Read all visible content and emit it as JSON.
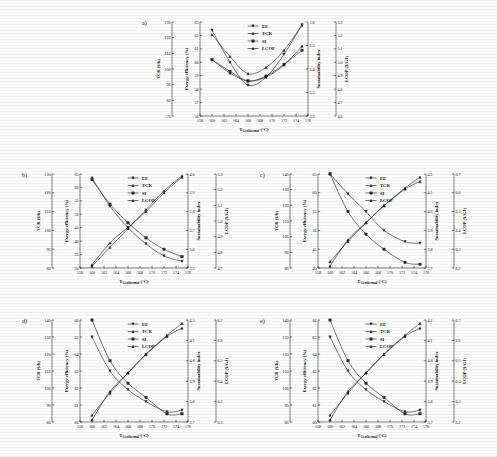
{
  "figure": {
    "background": "#ffffff",
    "xlabel": "T",
    "xlabel_sub": "Geothermal",
    "xlabel_unit": " (°C)",
    "legend": [
      {
        "key": "EE",
        "label": "EE",
        "marker": "triangle-down"
      },
      {
        "key": "TCR",
        "label": "TCR",
        "marker": "triangle-up"
      },
      {
        "key": "SI",
        "label": "SI",
        "marker": "square"
      },
      {
        "key": "LCOP",
        "label": "LCOP",
        "marker": "triangle-up"
      }
    ],
    "axis_titles": {
      "tcr": "TCR ($/h)",
      "ee": "Exergy efficiency (%)",
      "si": "Sustainability index",
      "lcop": "LCOP ($/GJ)"
    }
  },
  "chart_data": [
    {
      "id": "a",
      "panel_label": "a)",
      "type": "line",
      "title": "",
      "xlabel": "T_Geothermal (°C)",
      "x": [
        160,
        163,
        166,
        169,
        172,
        175
      ],
      "xlim": [
        158,
        176
      ],
      "xticks": [
        158,
        160,
        162,
        164,
        166,
        168,
        170,
        172,
        174,
        176
      ],
      "grid": false,
      "legend_position": "top-center",
      "axes": [
        {
          "name": "TCR ($/h)",
          "side": "left-outer",
          "lim": [
            70,
            130
          ],
          "ticks": [
            70,
            80,
            90,
            100,
            110,
            120,
            130
          ]
        },
        {
          "name": "Exergy efficiency (%)",
          "side": "left-inner",
          "lim": [
            56,
            63
          ],
          "ticks": [
            56,
            57,
            58,
            59,
            60,
            61,
            62,
            63
          ]
        },
        {
          "name": "Sustainability index",
          "side": "right-inner",
          "lim": [
            3.2,
            3.6
          ],
          "ticks": [
            3.2,
            3.3,
            3.4,
            3.5,
            3.6
          ]
        },
        {
          "name": "LCOP ($/GJ)",
          "side": "right-outer",
          "lim": [
            4.6,
            5.3
          ],
          "ticks": [
            4.6,
            4.7,
            4.8,
            4.9,
            5.0,
            5.1,
            5.2,
            5.3
          ]
        }
      ],
      "series": [
        {
          "name": "EE",
          "axis": "Exergy efficiency (%)",
          "values": [
            62.4,
            60.0,
            58.3,
            58.9,
            60.6,
            62.8
          ]
        },
        {
          "name": "TCR",
          "axis": "TCR ($/h)",
          "values": [
            122.0,
            108.0,
            97.0,
            101.0,
            112.0,
            128.0
          ]
        },
        {
          "name": "SI",
          "axis": "Sustainability index",
          "values": [
            3.44,
            3.39,
            3.35,
            3.37,
            3.42,
            3.48
          ]
        },
        {
          "name": "LCOP",
          "axis": "LCOP ($/GJ)",
          "values": [
            5.02,
            4.92,
            4.86,
            4.89,
            4.98,
            5.12
          ]
        }
      ]
    },
    {
      "id": "b",
      "panel_label": "b)",
      "type": "line",
      "xlabel": "T_Geothermal (°C)",
      "x": [
        160,
        163,
        166,
        169,
        172,
        175
      ],
      "xlim": [
        158,
        176
      ],
      "xticks": [
        158,
        160,
        162,
        164,
        166,
        168,
        170,
        172,
        174,
        176
      ],
      "grid": false,
      "legend_position": "top-center",
      "axes": [
        {
          "name": "TCR ($/h)",
          "side": "left-outer",
          "lim": [
            80,
            130
          ],
          "ticks": [
            80,
            90,
            100,
            110,
            120,
            130
          ]
        },
        {
          "name": "Exergy efficiency (%)",
          "side": "left-inner",
          "lim": [
            30,
            65
          ],
          "ticks": [
            30,
            35,
            40,
            45,
            50,
            55,
            60,
            65
          ]
        },
        {
          "name": "Sustainability index",
          "side": "right-inner",
          "lim": [
            3.5,
            4.0
          ],
          "ticks": [
            3.5,
            3.6,
            3.7,
            3.8,
            3.9,
            4.0
          ]
        },
        {
          "name": "LCOP ($/GJ)",
          "side": "right-outer",
          "lim": [
            4.7,
            5.3
          ],
          "ticks": [
            4.7,
            4.8,
            4.9,
            5.0,
            5.1,
            5.2,
            5.3
          ]
        }
      ],
      "series": [
        {
          "name": "EE",
          "axis": "Exergy efficiency (%)",
          "values": [
            63.5,
            53.0,
            45.0,
            39.0,
            34.5,
            32.5
          ]
        },
        {
          "name": "TCR",
          "axis": "TCR ($/h)",
          "values": [
            81.0,
            91.0,
            101.0,
            111.0,
            121.0,
            129.0
          ]
        },
        {
          "name": "SI",
          "axis": "Sustainability index",
          "values": [
            3.97,
            3.84,
            3.74,
            3.66,
            3.6,
            3.56
          ]
        },
        {
          "name": "LCOP",
          "axis": "LCOP ($/GJ)",
          "values": [
            4.72,
            4.86,
            4.96,
            5.06,
            5.18,
            5.28
          ]
        }
      ]
    },
    {
      "id": "c",
      "panel_label": "c)",
      "type": "line",
      "xlabel": "T_Geothermal (°C)",
      "x": [
        160,
        163,
        166,
        169,
        172.5,
        175
      ],
      "xlim": [
        158,
        176
      ],
      "xticks": [
        158,
        160,
        162,
        164,
        166,
        168,
        170,
        172,
        174,
        176
      ],
      "grid": false,
      "legend_position": "top-center",
      "axes": [
        {
          "name": "TCR ($/h)",
          "side": "left-outer",
          "lim": [
            80,
            140
          ],
          "ticks": [
            80,
            90,
            100,
            110,
            120,
            130,
            140
          ]
        },
        {
          "name": "Exergy efficiency (%)",
          "side": "left-inner",
          "lim": [
            40,
            65
          ],
          "ticks": [
            40,
            45,
            50,
            55,
            60,
            65
          ]
        },
        {
          "name": "Sustainability index",
          "side": "right-inner",
          "lim": [
            3.7,
            4.2
          ],
          "ticks": [
            3.7,
            3.8,
            3.9,
            4.0,
            4.1,
            4.2
          ]
        },
        {
          "name": "LCOP ($/GJ)",
          "side": "right-outer",
          "lim": [
            6.2,
            6.7
          ],
          "ticks": [
            6.2,
            6.3,
            6.4,
            6.5,
            6.6,
            6.7
          ]
        }
      ],
      "series": [
        {
          "name": "EE",
          "axis": "Exergy efficiency (%)",
          "values": [
            65.0,
            59.7,
            55.0,
            50.0,
            47.0,
            46.6
          ]
        },
        {
          "name": "TCR",
          "axis": "TCR ($/h)",
          "values": [
            84.0,
            97.0,
            109.0,
            120.0,
            131.0,
            138.0
          ]
        },
        {
          "name": "SI",
          "axis": "Sustainability index",
          "values": [
            4.2,
            4.0,
            3.88,
            3.8,
            3.73,
            3.72
          ]
        },
        {
          "name": "LCOP",
          "axis": "LCOP ($/GJ)",
          "values": [
            6.21,
            6.35,
            6.44,
            6.53,
            6.62,
            6.66
          ]
        }
      ]
    },
    {
      "id": "d",
      "panel_label": "d)",
      "type": "line",
      "xlabel": "T_Geothermal (°C)",
      "x": [
        160,
        163,
        166,
        169,
        172.5,
        175
      ],
      "xlim": [
        158,
        176
      ],
      "xticks": [
        158,
        160,
        162,
        164,
        166,
        168,
        170,
        172,
        174,
        176
      ],
      "grid": false,
      "legend_position": "top-center",
      "axes": [
        {
          "name": "TCR ($/h)",
          "side": "left-outer",
          "lim": [
            80,
            140
          ],
          "ticks": [
            80,
            90,
            100,
            110,
            120,
            130,
            140
          ]
        },
        {
          "name": "Exergy efficiency (%)",
          "side": "left-inner",
          "lim": [
            60,
            66
          ],
          "ticks": [
            60,
            61,
            62,
            63,
            64,
            65,
            66
          ]
        },
        {
          "name": "Sustainability index",
          "side": "right-inner",
          "lim": [
            3.7,
            4.2
          ],
          "ticks": [
            3.7,
            3.8,
            3.9,
            4.0,
            4.1,
            4.2
          ]
        },
        {
          "name": "LCOP ($/GJ)",
          "side": "right-outer",
          "lim": [
            6.2,
            6.7
          ],
          "ticks": [
            6.2,
            6.3,
            6.4,
            6.5,
            6.6,
            6.7
          ]
        }
      ],
      "series": [
        {
          "name": "EE",
          "axis": "Exergy efficiency (%)",
          "values": [
            65.0,
            63.0,
            61.9,
            61.2,
            60.6,
            60.7
          ]
        },
        {
          "name": "TCR",
          "axis": "TCR ($/h)",
          "values": [
            84.0,
            97.0,
            109.0,
            120.0,
            131.0,
            138.0
          ]
        },
        {
          "name": "SI",
          "axis": "Sustainability index",
          "values": [
            4.2,
            4.0,
            3.89,
            3.82,
            3.74,
            3.74
          ]
        },
        {
          "name": "LCOP",
          "axis": "LCOP ($/GJ)",
          "values": [
            6.21,
            6.35,
            6.44,
            6.53,
            6.62,
            6.66
          ]
        }
      ]
    },
    {
      "id": "e",
      "panel_label": "e)",
      "type": "line",
      "xlabel": "T_Geothermal (°C)",
      "x": [
        160,
        163,
        166,
        169,
        172.5,
        175
      ],
      "xlim": [
        158,
        176
      ],
      "xticks": [
        158,
        160,
        162,
        164,
        166,
        168,
        170,
        172,
        174,
        176
      ],
      "grid": false,
      "legend_position": "top-center",
      "axes": [
        {
          "name": "TCR ($/h)",
          "side": "left-outer",
          "lim": [
            80,
            140
          ],
          "ticks": [
            80,
            90,
            100,
            110,
            120,
            130,
            140
          ]
        },
        {
          "name": "Exergy efficiency (%)",
          "side": "left-inner",
          "lim": [
            60,
            66
          ],
          "ticks": [
            60,
            61,
            62,
            63,
            64,
            65,
            66
          ]
        },
        {
          "name": "Sustainability index",
          "side": "right-inner",
          "lim": [
            3.7,
            4.2
          ],
          "ticks": [
            3.7,
            3.8,
            3.9,
            4.0,
            4.1,
            4.2
          ]
        },
        {
          "name": "LCOP ($/GJ)",
          "side": "right-outer",
          "lim": [
            6.2,
            6.7
          ],
          "ticks": [
            6.2,
            6.3,
            6.4,
            6.5,
            6.6,
            6.7
          ]
        }
      ],
      "series": [
        {
          "name": "EE",
          "axis": "Exergy efficiency (%)",
          "values": [
            65.0,
            63.0,
            61.9,
            61.2,
            60.6,
            60.7
          ]
        },
        {
          "name": "TCR",
          "axis": "TCR ($/h)",
          "values": [
            84.0,
            97.0,
            109.0,
            120.0,
            131.0,
            138.0
          ]
        },
        {
          "name": "SI",
          "axis": "Sustainability index",
          "values": [
            4.2,
            4.0,
            3.89,
            3.82,
            3.74,
            3.74
          ]
        },
        {
          "name": "LCOP",
          "axis": "LCOP ($/GJ)",
          "values": [
            6.21,
            6.35,
            6.44,
            6.53,
            6.62,
            6.66
          ]
        }
      ]
    }
  ]
}
